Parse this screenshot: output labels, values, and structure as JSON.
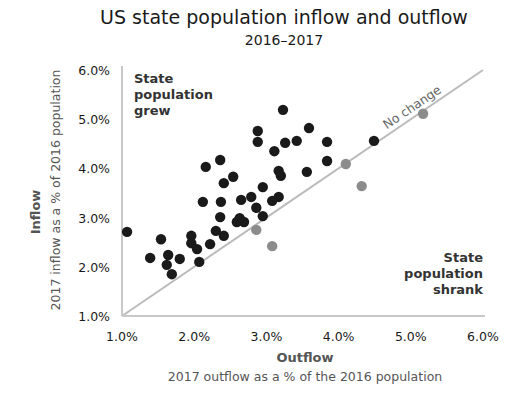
{
  "chart_data": {
    "type": "scatter",
    "title": "US state population inflow and outflow",
    "subtitle": "2016–2017",
    "xlabel": "Outflow",
    "xlabel_sub": "2017 outflow as a % of the 2016 population",
    "ylabel": "Inflow",
    "ylabel_sub": "2017 inflow as a % of 2016 population",
    "xlim": [
      1.0,
      6.0
    ],
    "ylim": [
      1.0,
      6.0
    ],
    "x_ticks": [
      "1.0%",
      "2.0%",
      "3.0%",
      "4.0%",
      "5.0%",
      "6.0%"
    ],
    "y_ticks": [
      "1.0%",
      "2.0%",
      "3.0%",
      "4.0%",
      "5.0%",
      "6.0%"
    ],
    "grid": false,
    "reference_line": {
      "label": "No change",
      "from": [
        1.0,
        1.0
      ],
      "to": [
        6.0,
        6.0
      ],
      "color": "#bbbbbb"
    },
    "annotations": {
      "grew": [
        "State",
        "population",
        "grew"
      ],
      "shrank": [
        "State",
        "population",
        "shrank"
      ]
    },
    "series": [
      {
        "name": "State population grew",
        "color": "#1a1a1a",
        "points": [
          [
            1.07,
            2.71
          ],
          [
            1.54,
            2.56
          ],
          [
            1.39,
            2.18
          ],
          [
            1.64,
            2.24
          ],
          [
            1.62,
            2.04
          ],
          [
            1.69,
            1.85
          ],
          [
            1.8,
            2.16
          ],
          [
            1.96,
            2.63
          ],
          [
            1.96,
            2.48
          ],
          [
            2.04,
            2.36
          ],
          [
            2.07,
            2.1
          ],
          [
            2.22,
            2.46
          ],
          [
            2.3,
            2.73
          ],
          [
            2.41,
            2.63
          ],
          [
            2.36,
            3.01
          ],
          [
            2.12,
            3.32
          ],
          [
            2.37,
            3.32
          ],
          [
            2.59,
            2.91
          ],
          [
            2.63,
            2.99
          ],
          [
            2.69,
            2.91
          ],
          [
            2.65,
            3.36
          ],
          [
            2.79,
            3.42
          ],
          [
            2.86,
            3.2
          ],
          [
            2.95,
            3.03
          ],
          [
            3.08,
            3.34
          ],
          [
            3.17,
            3.42
          ],
          [
            2.95,
            3.62
          ],
          [
            3.17,
            3.95
          ],
          [
            3.2,
            3.85
          ],
          [
            3.56,
            3.93
          ],
          [
            3.84,
            4.15
          ],
          [
            2.16,
            4.03
          ],
          [
            2.36,
            4.17
          ],
          [
            2.54,
            3.83
          ],
          [
            2.41,
            3.7
          ],
          [
            3.11,
            4.35
          ],
          [
            2.88,
            4.76
          ],
          [
            2.88,
            4.54
          ],
          [
            3.26,
            4.52
          ],
          [
            3.42,
            4.56
          ],
          [
            3.23,
            5.19
          ],
          [
            3.59,
            4.82
          ],
          [
            3.84,
            4.54
          ],
          [
            4.49,
            4.56
          ]
        ]
      },
      {
        "name": "State population shrank",
        "color": "#8c8c8c",
        "points": [
          [
            2.86,
            2.75
          ],
          [
            3.08,
            2.42
          ],
          [
            4.1,
            4.09
          ],
          [
            4.32,
            3.64
          ],
          [
            5.17,
            5.11
          ]
        ]
      }
    ]
  }
}
